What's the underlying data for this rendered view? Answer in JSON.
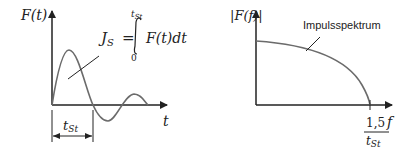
{
  "left_diagram": {
    "y_axis_label": "F(t)",
    "x_axis_label": "t",
    "integral": {
      "lhs": "J",
      "lhs_sub": "S",
      "equals": "=",
      "upper_limit": "t",
      "upper_limit_sub": "St",
      "lower_limit": "0",
      "integrand": "F(t)dt"
    },
    "duration_label": "t",
    "duration_label_sub": "St"
  },
  "right_diagram": {
    "y_axis_label": "|F(f)|",
    "x_axis_label": "f",
    "curve_label": "Impulsspektrum",
    "tick_numerator": "1,5",
    "tick_denominator": "t",
    "tick_denominator_sub": "St"
  },
  "colors": {
    "axis": "#222222",
    "curve": "#6b6b6b"
  }
}
